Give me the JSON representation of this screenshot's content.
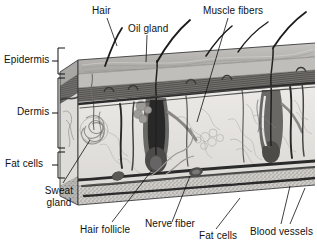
{
  "figure": {
    "type": "anatomical-illustration",
    "style": "grayscale-3d-block",
    "background_color": "#ffffff",
    "ink_color": "#111111"
  },
  "layer_labels": [
    {
      "id": "epidermis",
      "text": "Epidermis",
      "bracket": true,
      "side": "left"
    },
    {
      "id": "dermis",
      "text": "Dermis",
      "bracket": true,
      "side": "left"
    },
    {
      "id": "fat-cells-left",
      "text": "Fat cells",
      "bracket": true,
      "side": "left"
    }
  ],
  "callouts": [
    {
      "id": "hair",
      "text": "Hair",
      "position": "top-left"
    },
    {
      "id": "oil-gland",
      "text": "Oil gland",
      "position": "top-center"
    },
    {
      "id": "muscle-fibers",
      "text": "Muscle fibers",
      "position": "top-right"
    },
    {
      "id": "sweat-gland",
      "text": "Sweat gland",
      "position": "bottom-left",
      "lines": [
        "Sweat",
        "gland"
      ]
    },
    {
      "id": "hair-follicle",
      "text": "Hair follicle",
      "position": "bottom-left"
    },
    {
      "id": "nerve-fiber",
      "text": "Nerve fiber",
      "position": "bottom-center"
    },
    {
      "id": "fat-cells",
      "text": "Fat cells",
      "position": "bottom-right"
    },
    {
      "id": "blood-vessels",
      "text": "Blood vessels",
      "position": "bottom-far-right",
      "leader_count": 2
    }
  ],
  "palette": {
    "top_surface": "#b9b7b4",
    "epidermis_band": "#7c7a78",
    "dermis_fill": "#e6e4e1",
    "fat_band": "#c9c7c3",
    "vessel_dark": "#2c2c2c",
    "follicle": "#6e6c6a",
    "side_face": "#a6a4a1"
  }
}
